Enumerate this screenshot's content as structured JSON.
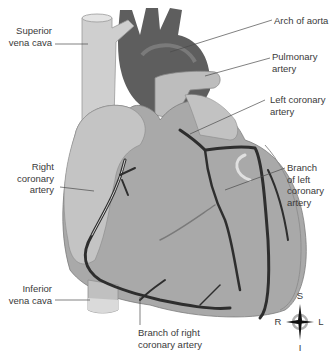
{
  "diagram": {
    "labels": {
      "superior_vena_cava": [
        "Superior",
        "vena cava"
      ],
      "arch_of_aorta": [
        "Arch of aorta"
      ],
      "pulmonary_artery": [
        "Pulmonary",
        "artery"
      ],
      "left_coronary_artery": [
        "Left coronary",
        "artery"
      ],
      "branch_of_left_coronary_artery": [
        "Branch",
        "of left",
        "coronary",
        "artery"
      ],
      "right_coronary_artery": [
        "Right",
        "coronary",
        "artery"
      ],
      "inferior_vena_cava": [
        "Inferior",
        "vena cava"
      ],
      "branch_of_right_coronary_artery": [
        "Branch of right",
        "coronary artery"
      ]
    },
    "compass": {
      "top": "S",
      "bottom": "I",
      "left": "R",
      "right": "L"
    },
    "colors": {
      "heart": "#a9a9a9",
      "atrium": "#c4c4c4",
      "aorta": "#5e5e5e",
      "vena_cava": "#cfcfcf",
      "artery": "#2e2e2e",
      "leader": "#4a4a4a"
    }
  }
}
